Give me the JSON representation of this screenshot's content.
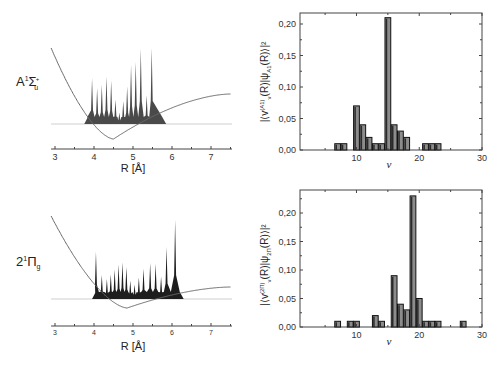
{
  "chart_data": [
    {
      "id": "top-left",
      "type": "area",
      "title": "",
      "state_label": "A¹Σu⁺",
      "state_main": "A",
      "state_sup": "1",
      "state_sym": "Σ",
      "state_sub": "u",
      "state_supsym": "+",
      "xlabel": "R [Å]",
      "ylabel": "",
      "xlim": [
        2.9,
        7.5
      ],
      "xticks": [
        3,
        4,
        5,
        6,
        7
      ],
      "grid": false,
      "potential_curve": {
        "min_R": 4.5,
        "baseline_R_left": 3.75,
        "baseline_R_right": 5.85
      },
      "wavefunction_peaks": {
        "R": [
          3.95,
          4.08,
          4.2,
          4.32,
          4.44,
          4.55,
          4.65,
          4.75,
          4.85,
          4.95,
          5.07,
          5.2,
          5.35,
          5.48
        ],
        "height": [
          0.56,
          0.44,
          0.48,
          0.58,
          0.53,
          0.3,
          0.14,
          0.28,
          0.46,
          0.72,
          0.76,
          0.92,
          0.35,
          0.93
        ]
      }
    },
    {
      "id": "top-right",
      "type": "bar",
      "title": "",
      "xlabel": "ν",
      "ylabel": "|⟨v^(A1)_ν(R)|ψ_A1(R)⟩|²",
      "xlim": [
        1,
        30
      ],
      "ylim": [
        0,
        0.22
      ],
      "xticks": [
        10,
        20,
        30
      ],
      "yticks": [
        "0,00",
        "0,05",
        "0,10",
        "0,15",
        "0,20"
      ],
      "grid": false,
      "x": [
        7,
        8,
        10,
        11,
        12,
        13,
        14,
        15,
        16,
        17,
        18,
        21,
        22,
        23
      ],
      "values": [
        0.01,
        0.01,
        0.07,
        0.04,
        0.02,
        0.01,
        0.01,
        0.21,
        0.04,
        0.03,
        0.02,
        0.01,
        0.01,
        0.01
      ]
    },
    {
      "id": "bottom-left",
      "type": "area",
      "title": "",
      "state_label": "2¹Πg",
      "state_main": "2",
      "state_sup": "1",
      "state_sym": "Π",
      "state_sub": "g",
      "xlabel": "R [Å]",
      "ylabel": "",
      "xlim": [
        2.9,
        7.5
      ],
      "xticks": [
        3,
        4,
        5,
        6,
        7
      ],
      "grid": false,
      "potential_curve": {
        "min_R": 4.85,
        "baseline_R_left": 3.95,
        "baseline_R_right": 6.3
      },
      "wavefunction_peaks": {
        "R": [
          4.05,
          4.2,
          4.33,
          4.43,
          4.53,
          4.63,
          4.73,
          4.83,
          4.93,
          5.04,
          5.15,
          5.27,
          5.44,
          5.58,
          5.72,
          5.86,
          6.08
        ],
        "height": [
          0.59,
          0.3,
          0.25,
          0.31,
          0.37,
          0.43,
          0.46,
          0.4,
          0.23,
          0.18,
          0.27,
          0.38,
          0.45,
          0.44,
          0.28,
          0.65,
          0.99
        ]
      }
    },
    {
      "id": "bottom-right",
      "type": "bar",
      "title": "",
      "xlabel": "ν",
      "ylabel": "|⟨v^(2Π)_ν(R)|ψ_2Π(R)⟩|²",
      "xlim": [
        1,
        30
      ],
      "ylim": [
        0,
        0.24
      ],
      "xticks": [
        10,
        20,
        30
      ],
      "yticks": [
        "0,00",
        "0,05",
        "0,10",
        "0,15",
        "0,20"
      ],
      "grid": false,
      "x": [
        7,
        9,
        10,
        13,
        14,
        16,
        17,
        18,
        19,
        20,
        21,
        22,
        23,
        27
      ],
      "values": [
        0.01,
        0.01,
        0.01,
        0.02,
        0.01,
        0.09,
        0.04,
        0.03,
        0.23,
        0.05,
        0.01,
        0.01,
        0.01,
        0.01
      ]
    }
  ],
  "labels": {
    "r_axis": "R [Å]",
    "nu_axis": "ν",
    "top_ylabel_main": "|⟨v",
    "top_ylabel_sup": "(A1)",
    "top_ylabel_sub": "ν",
    "top_ylabel_mid": "(R)|ψ",
    "top_ylabel_sub2": "A1",
    "top_ylabel_end": "(R)⟩|²",
    "bottom_ylabel_sup": "(2Π)",
    "bottom_ylabel_sub2": "2Π"
  },
  "colors": {
    "bar_fill": "#8c8c8c",
    "bar_edge": "#111111",
    "peak_fill": "#4a4a4a",
    "peak_fill_dark": "#1e1e1e",
    "curve": "#6a6a6a",
    "axis": "#444444",
    "baseline": "#cfcfcf"
  }
}
